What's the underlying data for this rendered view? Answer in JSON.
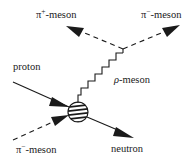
{
  "diagram": {
    "type": "feynman-diagram",
    "labels": {
      "pi_plus_symbol": "π",
      "pi_plus_sup": "+",
      "pi_plus_suffix": "-meson",
      "pi_minus_out_symbol": "π",
      "pi_minus_out_sup": "−",
      "pi_minus_out_suffix": "-meson",
      "proton": "proton",
      "rho_symbol": "ρ",
      "rho_suffix": "-meson",
      "pi_minus_in_symbol": "π",
      "pi_minus_in_sup": "−",
      "pi_minus_in_suffix": "-meson",
      "neutron": "neutron"
    },
    "particles": [
      {
        "name": "proton",
        "role": "incoming",
        "line": "solid"
      },
      {
        "name": "π⁻-meson",
        "role": "incoming",
        "line": "dashed"
      },
      {
        "name": "neutron",
        "role": "outgoing",
        "line": "solid"
      },
      {
        "name": "ρ-meson",
        "role": "intermediate",
        "line": "zigzag"
      },
      {
        "name": "π⁺-meson",
        "role": "outgoing",
        "line": "dashed"
      },
      {
        "name": "π⁻-meson",
        "role": "outgoing",
        "line": "dashed"
      }
    ],
    "colors": {
      "ink": "#1a1a1a",
      "background": "#ffffff"
    }
  }
}
